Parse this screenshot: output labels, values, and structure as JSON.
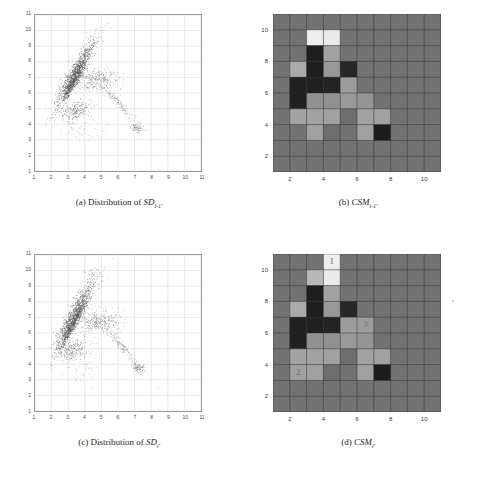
{
  "figure": {
    "panels": [
      {
        "key": "a",
        "tag": "(a)",
        "caption_text": "Distribution of",
        "caption_symbol": "SD",
        "caption_sub": "i-1",
        "caption_period": ".",
        "type": "scatter"
      },
      {
        "key": "b",
        "tag": "(b)",
        "caption_text": "",
        "caption_symbol": "CSM",
        "caption_sub": "i-1",
        "caption_period": ".",
        "type": "heatmap"
      },
      {
        "key": "c",
        "tag": "(c)",
        "caption_text": "Distribution of",
        "caption_symbol": "SD",
        "caption_sub": "i",
        "caption_period": ".",
        "type": "scatter"
      },
      {
        "key": "d",
        "tag": "(d)",
        "caption_text": "",
        "caption_symbol": "CSM",
        "caption_sub": "i",
        "caption_period": ".",
        "type": "heatmap"
      }
    ]
  },
  "colors": {
    "heatmap_background": "#4a4a4a",
    "heatmap_gridline": "#2b2b2b",
    "scatter_point": "#555555",
    "scatter_gridline": "#c8c8d2",
    "label_text": "#6b6b6b"
  },
  "chart_data": [
    {
      "type": "scatter",
      "panel": "a",
      "title": "Distribution of SD_{i-1}",
      "xlabel": "",
      "ylabel": "",
      "xlim": [
        1,
        11
      ],
      "ylim": [
        1,
        11
      ],
      "xticks": [
        1,
        2,
        3,
        4,
        5,
        6,
        7,
        8,
        9,
        10,
        11
      ],
      "yticks": [
        1,
        2,
        3,
        4,
        5,
        6,
        7,
        8,
        9,
        10,
        11
      ],
      "xticklabels": [
        "1",
        "2",
        "3",
        "4",
        "5",
        "6",
        "7",
        "8",
        "9",
        "10",
        "11"
      ],
      "yticklabels": [
        "1",
        "2",
        "3",
        "4",
        "5",
        "6",
        "7",
        "8",
        "9",
        "10",
        "11"
      ],
      "grid": true,
      "legend": null,
      "clusters": [
        {
          "name": "main-ridge",
          "cx": 3.45,
          "cy": 7.3,
          "angle_deg": 62,
          "len": 3.6,
          "wid": 0.42,
          "n": 900,
          "density": "dense"
        },
        {
          "name": "ridge-core",
          "cx": 3.3,
          "cy": 6.6,
          "angle_deg": 62,
          "len": 2.4,
          "wid": 0.22,
          "n": 400,
          "density": "dense"
        },
        {
          "name": "lower-blob",
          "cx": 3.45,
          "cy": 4.85,
          "angle_deg": 20,
          "len": 1.5,
          "wid": 0.6,
          "n": 260,
          "density": "medium"
        },
        {
          "name": "mid-band",
          "cx": 4.75,
          "cy": 6.85,
          "angle_deg": 5,
          "len": 2.1,
          "wid": 0.85,
          "n": 330,
          "density": "medium"
        },
        {
          "name": "arc-tail",
          "cx": 6.1,
          "cy": 5.3,
          "angle_deg": -48,
          "len": 2.8,
          "wid": 0.3,
          "n": 160,
          "density": "sparse"
        },
        {
          "name": "right-knot",
          "cx": 7.15,
          "cy": 3.75,
          "angle_deg": 0,
          "len": 0.55,
          "wid": 0.3,
          "n": 70,
          "density": "medium"
        },
        {
          "name": "upper-scatter",
          "cx": 4.6,
          "cy": 9.2,
          "angle_deg": 70,
          "len": 1.8,
          "wid": 0.8,
          "n": 70,
          "density": "sparse"
        },
        {
          "name": "stray",
          "cx": 4.0,
          "cy": 3.6,
          "angle_deg": 0,
          "len": 2.2,
          "wid": 1.0,
          "n": 45,
          "density": "sparse"
        }
      ]
    },
    {
      "type": "heatmap",
      "panel": "b",
      "title": "CSM_{i-1}",
      "xlabel": "",
      "ylabel": "",
      "xlim": [
        1,
        11
      ],
      "ylim": [
        1,
        11
      ],
      "xticks": [
        2,
        4,
        6,
        8,
        10
      ],
      "yticks": [
        2,
        4,
        6,
        8,
        10
      ],
      "xticklabels": [
        "2",
        "4",
        "6",
        "8",
        "10"
      ],
      "yticklabels": [
        "2",
        "4",
        "6",
        "8",
        "10"
      ],
      "grid": true,
      "background_value": 0.42,
      "cells": [
        {
          "x": 3,
          "y": 9,
          "v": 0.95
        },
        {
          "x": 4,
          "y": 9,
          "v": 0.93
        },
        {
          "x": 3,
          "y": 8,
          "v": 0.06
        },
        {
          "x": 4,
          "y": 8,
          "v": 0.62
        },
        {
          "x": 2,
          "y": 7,
          "v": 0.66
        },
        {
          "x": 3,
          "y": 7,
          "v": 0.06
        },
        {
          "x": 4,
          "y": 7,
          "v": 0.58
        },
        {
          "x": 5,
          "y": 7,
          "v": 0.1
        },
        {
          "x": 2,
          "y": 6,
          "v": 0.07
        },
        {
          "x": 3,
          "y": 6,
          "v": 0.07
        },
        {
          "x": 4,
          "y": 6,
          "v": 0.08
        },
        {
          "x": 5,
          "y": 6,
          "v": 0.6
        },
        {
          "x": 2,
          "y": 5,
          "v": 0.07
        },
        {
          "x": 3,
          "y": 5,
          "v": 0.55
        },
        {
          "x": 4,
          "y": 5,
          "v": 0.55
        },
        {
          "x": 5,
          "y": 5,
          "v": 0.58
        },
        {
          "x": 6,
          "y": 5,
          "v": 0.57
        },
        {
          "x": 2,
          "y": 4,
          "v": 0.63
        },
        {
          "x": 3,
          "y": 4,
          "v": 0.63
        },
        {
          "x": 4,
          "y": 4,
          "v": 0.62
        },
        {
          "x": 5,
          "y": 4,
          "v": 0.4
        },
        {
          "x": 6,
          "y": 4,
          "v": 0.63
        },
        {
          "x": 7,
          "y": 4,
          "v": 0.62
        },
        {
          "x": 3,
          "y": 3,
          "v": 0.62
        },
        {
          "x": 4,
          "y": 3,
          "v": 0.4
        },
        {
          "x": 6,
          "y": 3,
          "v": 0.62
        },
        {
          "x": 7,
          "y": 3,
          "v": 0.05
        }
      ],
      "annotations": []
    },
    {
      "type": "scatter",
      "panel": "c",
      "title": "Distribution of SD_i",
      "xlabel": "",
      "ylabel": "",
      "xlim": [
        1,
        11
      ],
      "ylim": [
        1,
        11
      ],
      "xticks": [
        1,
        2,
        3,
        4,
        5,
        6,
        7,
        8,
        9,
        10,
        11
      ],
      "yticks": [
        1,
        2,
        3,
        4,
        5,
        6,
        7,
        8,
        9,
        10,
        11
      ],
      "xticklabels": [
        "1",
        "2",
        "3",
        "4",
        "5",
        "6",
        "7",
        "8",
        "9",
        "10",
        "11"
      ],
      "yticklabels": [
        "1",
        "2",
        "3",
        "4",
        "5",
        "6",
        "7",
        "8",
        "9",
        "10",
        "11"
      ],
      "grid": true,
      "legend": null,
      "clusters": [
        {
          "name": "main-ridge",
          "cx": 3.4,
          "cy": 7.1,
          "angle_deg": 64,
          "len": 3.8,
          "wid": 0.45,
          "n": 950,
          "density": "dense"
        },
        {
          "name": "ridge-core",
          "cx": 3.25,
          "cy": 6.5,
          "angle_deg": 64,
          "len": 2.6,
          "wid": 0.22,
          "n": 420,
          "density": "dense"
        },
        {
          "name": "lower-blob",
          "cx": 3.3,
          "cy": 4.9,
          "angle_deg": 25,
          "len": 1.6,
          "wid": 0.7,
          "n": 280,
          "density": "medium"
        },
        {
          "name": "mid-band",
          "cx": 4.85,
          "cy": 6.8,
          "angle_deg": 3,
          "len": 2.2,
          "wid": 0.8,
          "n": 340,
          "density": "medium"
        },
        {
          "name": "arc-tail",
          "cx": 6.2,
          "cy": 5.2,
          "angle_deg": -52,
          "len": 3.0,
          "wid": 0.28,
          "n": 170,
          "density": "sparse"
        },
        {
          "name": "right-knot",
          "cx": 7.25,
          "cy": 3.8,
          "angle_deg": 0,
          "len": 0.6,
          "wid": 0.3,
          "n": 80,
          "density": "medium"
        },
        {
          "name": "upper-scatter",
          "cx": 4.5,
          "cy": 9.4,
          "angle_deg": 72,
          "len": 1.7,
          "wid": 0.7,
          "n": 70,
          "density": "sparse"
        },
        {
          "name": "stray",
          "cx": 3.9,
          "cy": 3.7,
          "angle_deg": 0,
          "len": 2.4,
          "wid": 1.1,
          "n": 50,
          "density": "sparse"
        }
      ]
    },
    {
      "type": "heatmap",
      "panel": "d",
      "title": "CSM_i",
      "xlabel": "",
      "ylabel": "",
      "xlim": [
        1,
        11
      ],
      "ylim": [
        1,
        11
      ],
      "xticks": [
        2,
        4,
        6,
        8,
        10
      ],
      "yticks": [
        2,
        4,
        6,
        8,
        10
      ],
      "xticklabels": [
        "2",
        "4",
        "6",
        "8",
        "10"
      ],
      "yticklabels": [
        "2",
        "4",
        "6",
        "8",
        "10"
      ],
      "grid": true,
      "background_value": 0.42,
      "cells": [
        {
          "x": 4,
          "y": 10,
          "v": 0.95
        },
        {
          "x": 3,
          "y": 9,
          "v": 0.72
        },
        {
          "x": 4,
          "y": 9,
          "v": 0.93
        },
        {
          "x": 3,
          "y": 8,
          "v": 0.06
        },
        {
          "x": 4,
          "y": 8,
          "v": 0.62
        },
        {
          "x": 2,
          "y": 7,
          "v": 0.66
        },
        {
          "x": 3,
          "y": 7,
          "v": 0.06
        },
        {
          "x": 4,
          "y": 7,
          "v": 0.58
        },
        {
          "x": 5,
          "y": 7,
          "v": 0.1
        },
        {
          "x": 2,
          "y": 6,
          "v": 0.07
        },
        {
          "x": 3,
          "y": 6,
          "v": 0.07
        },
        {
          "x": 4,
          "y": 6,
          "v": 0.08
        },
        {
          "x": 5,
          "y": 6,
          "v": 0.6
        },
        {
          "x": 6,
          "y": 6,
          "v": 0.6
        },
        {
          "x": 2,
          "y": 5,
          "v": 0.07
        },
        {
          "x": 3,
          "y": 5,
          "v": 0.55
        },
        {
          "x": 4,
          "y": 5,
          "v": 0.55
        },
        {
          "x": 5,
          "y": 5,
          "v": 0.58
        },
        {
          "x": 6,
          "y": 5,
          "v": 0.57
        },
        {
          "x": 2,
          "y": 4,
          "v": 0.63
        },
        {
          "x": 3,
          "y": 4,
          "v": 0.63
        },
        {
          "x": 4,
          "y": 4,
          "v": 0.62
        },
        {
          "x": 5,
          "y": 4,
          "v": 0.4
        },
        {
          "x": 6,
          "y": 4,
          "v": 0.63
        },
        {
          "x": 7,
          "y": 4,
          "v": 0.62
        },
        {
          "x": 2,
          "y": 3,
          "v": 0.62
        },
        {
          "x": 3,
          "y": 3,
          "v": 0.62
        },
        {
          "x": 4,
          "y": 3,
          "v": 0.4
        },
        {
          "x": 6,
          "y": 3,
          "v": 0.62
        },
        {
          "x": 7,
          "y": 3,
          "v": 0.05
        }
      ],
      "annotations": [
        {
          "label": "1",
          "x": 4,
          "y": 10
        },
        {
          "label": "2",
          "x": 2,
          "y": 3
        },
        {
          "label": "3",
          "x": 6,
          "y": 6
        }
      ]
    }
  ]
}
